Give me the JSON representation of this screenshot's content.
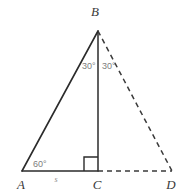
{
  "figure": {
    "background_color": "#ffffff",
    "solid_stroke_color": "#2b2b2b",
    "dashed_stroke_color": "#3a3a3a",
    "label_color": "#3a3a3a",
    "angle_label_color": "#7d7d7d",
    "side_label_color": "#8d8d8d"
  },
  "vertices": [
    {
      "name": "A",
      "label": "A",
      "x": 22,
      "y": 171,
      "label_x": 21,
      "label_y": 186
    },
    {
      "name": "B",
      "label": "B",
      "x": 98,
      "y": 31,
      "label_x": 95,
      "label_y": 16
    },
    {
      "name": "C",
      "label": "C",
      "x": 98,
      "y": 171,
      "label_x": 95,
      "label_y": 186
    },
    {
      "name": "D",
      "label": "D",
      "x": 172,
      "y": 171,
      "label_x": 168,
      "label_y": 186
    }
  ],
  "segments": [
    {
      "name": "AB",
      "from": "A",
      "to": "B",
      "style": "solid"
    },
    {
      "name": "BC",
      "from": "B",
      "to": "C",
      "style": "solid"
    },
    {
      "name": "AC",
      "from": "A",
      "to": "C",
      "style": "solid"
    },
    {
      "name": "BD",
      "from": "B",
      "to": "D",
      "style": "dashed"
    },
    {
      "name": "CD",
      "from": "C",
      "to": "D",
      "style": "dashed"
    }
  ],
  "angle_labels": [
    {
      "name": "angle-ABC",
      "text": "30°",
      "x": 82,
      "y": 69
    },
    {
      "name": "angle-CBD",
      "text": "30°",
      "x": 102,
      "y": 69
    },
    {
      "name": "angle-BAC",
      "text": "60°",
      "x": 34,
      "y": 166
    }
  ],
  "side_labels": [
    {
      "name": "segment-AC-length",
      "text": "s",
      "x": 56,
      "y": 182
    }
  ],
  "right_angle": {
    "name": "right-angle-at-C",
    "vertex": "C",
    "size": 14,
    "x": 84,
    "y": 157
  }
}
